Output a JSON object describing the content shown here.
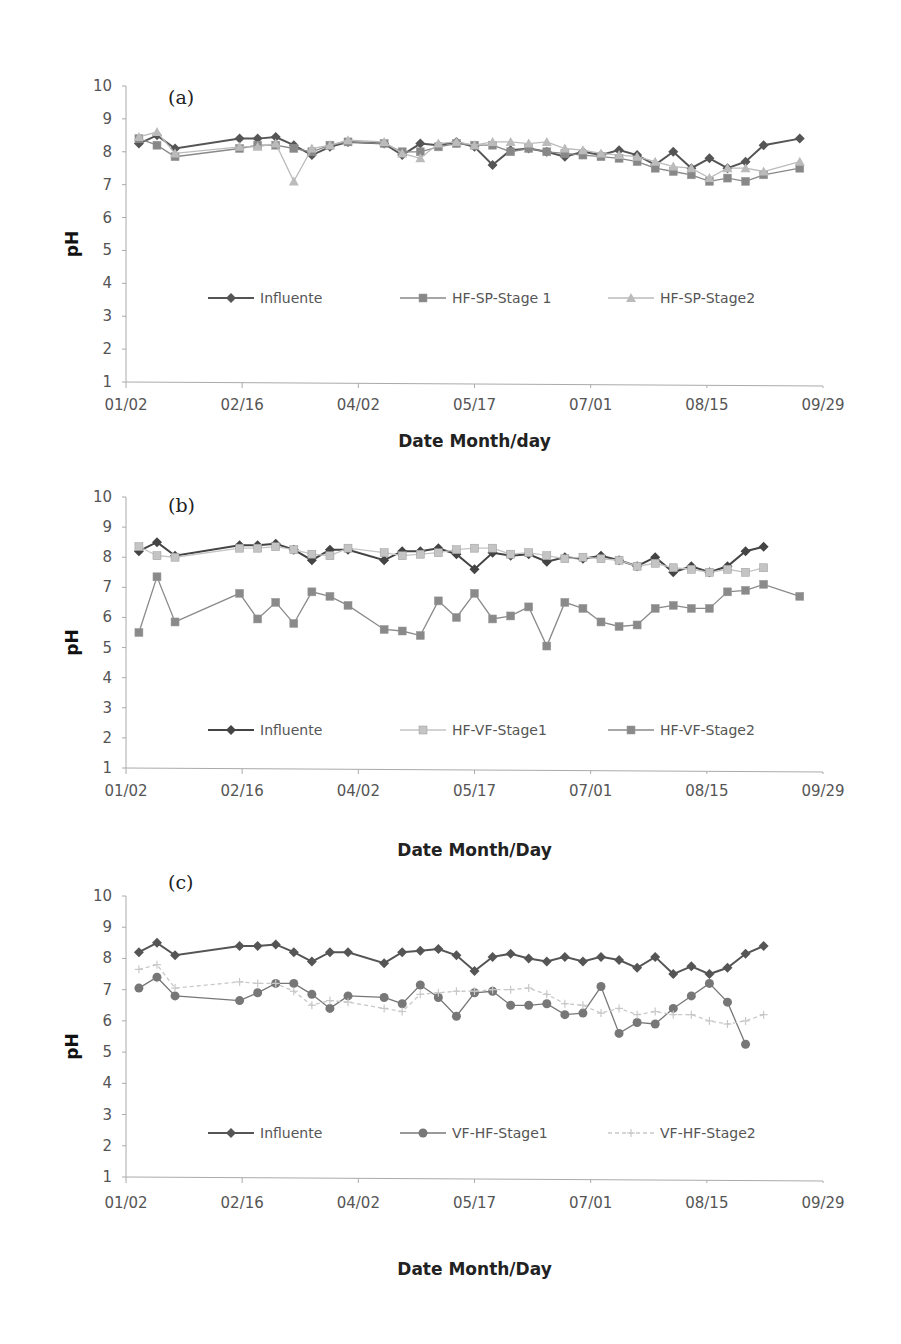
{
  "chart_data": [
    {
      "type": "line",
      "panel_label": "(a)",
      "title": "",
      "xlabel": "Date Month/day",
      "ylabel": "pH",
      "ylim": [
        1,
        10
      ],
      "yticks": [
        1,
        2,
        3,
        4,
        5,
        6,
        7,
        8,
        9,
        10
      ],
      "xticks": [
        "01/02",
        "02/16",
        "04/02",
        "05/17",
        "07/01",
        "08/15",
        "09/29"
      ],
      "grid": false,
      "legend_position": "inside-bottom",
      "x_day": [
        5,
        12,
        19,
        44,
        51,
        58,
        65,
        72,
        79,
        86,
        100,
        107,
        114,
        121,
        128,
        135,
        142,
        149,
        156,
        163,
        170,
        177,
        184,
        191,
        198,
        205,
        212,
        219,
        226,
        233,
        240,
        247,
        261
      ],
      "series": [
        {
          "name": "Influente",
          "marker": "diamond",
          "color": "#555555",
          "dash": "",
          "values": [
            8.25,
            8.5,
            8.1,
            8.4,
            8.4,
            8.45,
            8.2,
            7.9,
            8.15,
            8.3,
            8.25,
            7.9,
            8.25,
            8.2,
            8.3,
            8.15,
            7.6,
            8.05,
            8.1,
            8.0,
            7.85,
            8.0,
            7.9,
            8.05,
            7.9,
            7.6,
            8.0,
            7.5,
            7.8,
            7.5,
            7.7,
            8.2,
            8.4
          ]
        },
        {
          "name": "HF-SP-Stage 1",
          "marker": "square",
          "color": "#888888",
          "dash": "",
          "values": [
            8.4,
            8.2,
            7.85,
            8.1,
            8.2,
            8.2,
            8.1,
            8.0,
            8.2,
            8.3,
            8.25,
            8.0,
            8.0,
            8.15,
            8.25,
            8.2,
            8.2,
            8.0,
            8.1,
            8.0,
            7.95,
            7.9,
            7.85,
            7.8,
            7.7,
            7.5,
            7.4,
            7.3,
            7.1,
            7.2,
            7.1,
            7.3,
            7.5
          ]
        },
        {
          "name": "HF-SP-Stage2",
          "marker": "triangle",
          "color": "#bbbbbb",
          "dash": "",
          "values": [
            8.45,
            8.6,
            7.95,
            8.15,
            8.15,
            8.25,
            7.1,
            8.1,
            8.2,
            8.35,
            8.3,
            7.95,
            7.8,
            8.25,
            8.3,
            8.2,
            8.3,
            8.3,
            8.25,
            8.3,
            8.1,
            8.05,
            7.95,
            7.9,
            7.85,
            7.7,
            7.55,
            7.5,
            7.2,
            7.5,
            7.5,
            7.4,
            7.7
          ]
        }
      ],
      "legend": [
        "Influente",
        "HF-SP-Stage 1",
        "HF-SP-Stage2"
      ]
    },
    {
      "type": "line",
      "panel_label": "(b)",
      "title": "",
      "xlabel": "Date Month/Day",
      "ylabel": "pH",
      "ylim": [
        1,
        10
      ],
      "yticks": [
        1,
        2,
        3,
        4,
        5,
        6,
        7,
        8,
        9,
        10
      ],
      "xticks": [
        "01/02",
        "02/16",
        "04/02",
        "05/17",
        "07/01",
        "08/15",
        "09/29"
      ],
      "grid": false,
      "legend_position": "inside-bottom",
      "x_day": [
        5,
        12,
        19,
        44,
        51,
        58,
        65,
        72,
        79,
        86,
        100,
        107,
        114,
        121,
        128,
        135,
        142,
        149,
        156,
        163,
        170,
        177,
        184,
        191,
        198,
        205,
        212,
        219,
        226,
        233,
        240,
        247,
        261
      ],
      "series": [
        {
          "name": "Influente",
          "marker": "diamond",
          "color": "#444444",
          "dash": "",
          "values": [
            8.2,
            8.5,
            8.05,
            8.4,
            8.4,
            8.45,
            8.25,
            7.9,
            8.25,
            8.25,
            7.9,
            8.2,
            8.2,
            8.3,
            8.1,
            7.6,
            8.15,
            8.05,
            8.1,
            7.85,
            8.0,
            7.95,
            8.05,
            7.9,
            7.7,
            8.0,
            7.5,
            7.7,
            7.5,
            7.7,
            8.2,
            8.35
          ]
        },
        {
          "name": "HF-VF-Stage1",
          "marker": "square",
          "color": "#c4c4c4",
          "dash": "",
          "values": [
            8.35,
            8.05,
            8.0,
            8.3,
            8.3,
            8.35,
            8.25,
            8.1,
            8.05,
            8.3,
            8.15,
            8.05,
            8.1,
            8.15,
            8.25,
            8.3,
            8.3,
            8.1,
            8.15,
            8.05,
            7.95,
            8.0,
            7.95,
            7.9,
            7.7,
            7.8,
            7.65,
            7.6,
            7.5,
            7.6,
            7.5,
            7.65
          ]
        },
        {
          "name": "HF-VF-Stage2",
          "marker": "square",
          "color": "#8a8a8a",
          "dash": "",
          "values": [
            5.5,
            7.35,
            5.85,
            6.8,
            5.95,
            6.5,
            5.8,
            6.85,
            6.7,
            6.4,
            5.6,
            5.55,
            5.4,
            6.55,
            6.0,
            6.8,
            5.95,
            6.05,
            6.35,
            5.05,
            6.5,
            6.3,
            5.85,
            5.7,
            5.75,
            6.3,
            6.4,
            6.3,
            6.3,
            6.85,
            6.9,
            7.1,
            6.7
          ]
        }
      ],
      "legend": [
        "Influente",
        "HF-VF-Stage1",
        "HF-VF-Stage2"
      ]
    },
    {
      "type": "line",
      "panel_label": "(c)",
      "title": "",
      "xlabel": "Date Month/Day",
      "ylabel": "pH",
      "ylim": [
        1,
        10
      ],
      "yticks": [
        1,
        2,
        3,
        4,
        5,
        6,
        7,
        8,
        9,
        10
      ],
      "xticks": [
        "01/02",
        "02/16",
        "04/02",
        "05/17",
        "07/01",
        "08/15",
        "09/29"
      ],
      "grid": false,
      "legend_position": "inside-bottom",
      "x_day": [
        5,
        12,
        19,
        44,
        51,
        58,
        65,
        72,
        79,
        86,
        100,
        107,
        114,
        121,
        128,
        135,
        142,
        149,
        156,
        163,
        170,
        177,
        184,
        191,
        198,
        205,
        212,
        219,
        226,
        233,
        240,
        247,
        261
      ],
      "series": [
        {
          "name": "Influente",
          "marker": "diamond",
          "color": "#555555",
          "dash": "",
          "values": [
            8.2,
            8.5,
            8.1,
            8.4,
            8.4,
            8.45,
            8.2,
            7.9,
            8.2,
            8.2,
            7.85,
            8.2,
            8.25,
            8.3,
            8.1,
            7.6,
            8.05,
            8.15,
            8.0,
            7.9,
            8.05,
            7.9,
            8.05,
            7.95,
            7.7,
            8.05,
            7.5,
            7.75,
            7.5,
            7.7,
            8.15,
            8.4
          ]
        },
        {
          "name": "VF-HF-Stage1",
          "marker": "circle",
          "color": "#777777",
          "dash": "",
          "values": [
            7.05,
            7.4,
            6.8,
            6.65,
            6.9,
            7.2,
            7.2,
            6.85,
            6.4,
            6.8,
            6.75,
            6.55,
            7.15,
            6.75,
            6.15,
            6.9,
            6.95,
            6.5,
            6.5,
            6.55,
            6.2,
            6.25,
            7.1,
            5.6,
            5.95,
            5.9,
            6.4,
            6.8,
            7.2,
            6.6,
            5.25
          ]
        },
        {
          "name": "VF-HF-Stage2",
          "marker": "cross",
          "color": "#c8c8c8",
          "dash": "4,3",
          "values": [
            7.65,
            7.8,
            7.05,
            7.25,
            7.2,
            7.2,
            6.95,
            6.5,
            6.65,
            6.6,
            6.4,
            6.3,
            6.85,
            6.9,
            6.95,
            6.95,
            7.0,
            7.0,
            7.05,
            6.85,
            6.55,
            6.5,
            6.25,
            6.4,
            6.2,
            6.3,
            6.2,
            6.2,
            6.0,
            5.9,
            6.0,
            6.2
          ]
        }
      ],
      "legend": [
        "Influente",
        "VF-HF-Stage1",
        "VF-HF-Stage2"
      ]
    }
  ],
  "panels": [
    {
      "label": "(a)",
      "xlabel": "Date Month/day",
      "ylabel": "pH",
      "yticks": [
        "1",
        "2",
        "3",
        "4",
        "5",
        "6",
        "7",
        "8",
        "9",
        "10"
      ],
      "xticks": [
        "01/02",
        "02/16",
        "04/02",
        "05/17",
        "07/01",
        "08/15",
        "09/29"
      ],
      "legend": [
        "Influente",
        "HF-SP-Stage 1",
        "HF-SP-Stage2"
      ]
    },
    {
      "label": "(b)",
      "xlabel": "Date Month/Day",
      "ylabel": "pH",
      "yticks": [
        "1",
        "2",
        "3",
        "4",
        "5",
        "6",
        "7",
        "8",
        "9",
        "10"
      ],
      "xticks": [
        "01/02",
        "02/16",
        "04/02",
        "05/17",
        "07/01",
        "08/15",
        "09/29"
      ],
      "legend": [
        "Influente",
        "HF-VF-Stage1",
        "HF-VF-Stage2"
      ]
    },
    {
      "label": "(c)",
      "xlabel": "Date Month/Day",
      "ylabel": "pH",
      "yticks": [
        "1",
        "2",
        "3",
        "4",
        "5",
        "6",
        "7",
        "8",
        "9",
        "10"
      ],
      "xticks": [
        "01/02",
        "02/16",
        "04/02",
        "05/17",
        "07/01",
        "08/15",
        "09/29"
      ],
      "legend": [
        "Influente",
        "VF-HF-Stage1",
        "VF-HF-Stage2"
      ]
    }
  ]
}
